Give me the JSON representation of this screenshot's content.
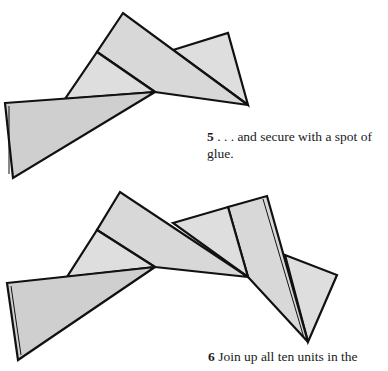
{
  "steps": [
    {
      "number": "5",
      "text": " . . . and secure with a spot of glue."
    },
    {
      "number": "6",
      "text": " Join up all ten units in the"
    }
  ],
  "figures": [
    {
      "id": "step-5-figure",
      "description": "Three folded triangular origami units joined together"
    },
    {
      "id": "step-6-figure",
      "description": "Five folded triangular origami units joined in a chain"
    }
  ],
  "colors": {
    "paper_fill": "#d8d8d8",
    "outline": "#111111",
    "background": "#ffffff"
  }
}
